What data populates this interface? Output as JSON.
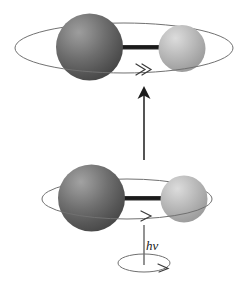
{
  "figure": {
    "type": "diagram",
    "background_color": "#ffffff",
    "width": 248,
    "height": 285
  },
  "labels": {
    "photon": "hν"
  },
  "colors": {
    "background": "#ffffff",
    "dark_atom_base": "#5a5a5a",
    "dark_atom_highlight": "#9a9a9a",
    "dark_atom_shadow": "#3c3c3c",
    "light_atom_base": "#b0b0b0",
    "light_atom_highlight": "#d8d8d8",
    "light_atom_shadow": "#8e8e8e",
    "bond": "#1c1c1c",
    "orbit_stroke": "#6f6f6f",
    "arrow_stroke": "#2a2a2a",
    "label_text": "#1a1a1a"
  },
  "elements": {
    "upper_molecule": {
      "name": "excited-state-molecule",
      "dark_atom": {
        "cx": 89.5,
        "cy": 47,
        "r": 33.5
      },
      "light_atom": {
        "cx": 182,
        "cy": 48.5,
        "r": 23.5
      },
      "bond": {
        "x1": 110,
        "y1": 47,
        "x2": 175,
        "y2": 47,
        "thickness": 4
      },
      "orbit": {
        "cx": 124,
        "cy": 48,
        "rx": 109,
        "ry": 25
      },
      "rotation_arrow": "double-chevron-right"
    },
    "lower_molecule": {
      "name": "ground-state-molecule",
      "dark_atom": {
        "cx": 91.5,
        "cy": 198,
        "r": 33.5
      },
      "light_atom": {
        "cx": 184,
        "cy": 199,
        "r": 23.5
      },
      "bond": {
        "x1": 112,
        "y1": 198,
        "x2": 177,
        "y2": 198,
        "thickness": 4
      },
      "orbit": {
        "cx": 127,
        "cy": 199,
        "rx": 85,
        "ry": 20
      },
      "rotation_arrow": "single-chevron-right"
    },
    "transition_arrow": {
      "name": "upward-transition-arrow",
      "x": 144,
      "y_tail": 160,
      "y_head": 88,
      "direction": "up"
    },
    "photon_path": {
      "name": "photon-vertical-line",
      "x": 144,
      "y_top": 225,
      "y_bottom": 265
    },
    "photon_spin_ellipse": {
      "name": "photon-polarization-ellipse",
      "cx": 144,
      "cy": 263,
      "rx": 26,
      "ry": 9,
      "arrow": "single-chevron-right"
    }
  }
}
